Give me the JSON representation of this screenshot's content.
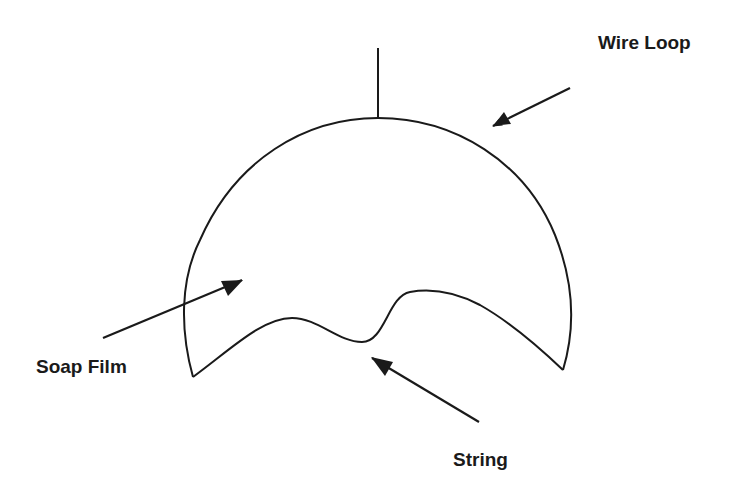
{
  "diagram": {
    "stroke_color": "#1a1a1a",
    "background": "#ffffff",
    "labels": {
      "wire_loop": "Wire Loop",
      "soap_film": "Soap Film",
      "string": "String"
    },
    "components": [
      {
        "id": "handle",
        "shape": "vertical line",
        "from": [
          378,
          48
        ],
        "to": [
          378,
          118
        ]
      },
      {
        "id": "wire-loop",
        "shape": "circular arc",
        "from": [
          193,
          377
        ],
        "to": [
          563,
          370
        ]
      },
      {
        "id": "string",
        "shape": "wavy curve",
        "from": [
          193,
          377
        ],
        "to": [
          563,
          370
        ]
      }
    ],
    "arrows": [
      {
        "label": "Wire Loop",
        "from": [
          570,
          88
        ],
        "to": [
          493,
          126
        ]
      },
      {
        "label": "Soap Film",
        "from": [
          103,
          338
        ],
        "to": [
          242,
          280
        ]
      },
      {
        "label": "String",
        "from": [
          479,
          422
        ],
        "to": [
          371,
          357
        ]
      }
    ]
  }
}
